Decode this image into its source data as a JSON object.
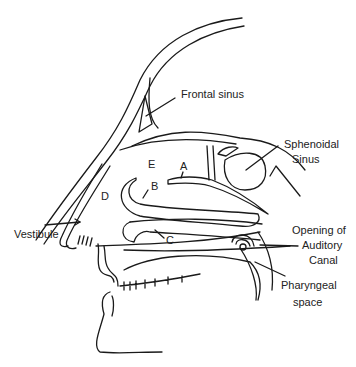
{
  "diagram": {
    "labels": {
      "frontal_sinus": "Frontal sinus",
      "sphenoidal_sinus_1": "Sphenoidal",
      "sphenoidal_sinus_2": "Sinus",
      "vestibule": "Vestibule",
      "auditory_1": "Opening of",
      "auditory_2": "Auditory",
      "auditory_3": "Canal",
      "pharyngeal_1": "Pharyngeal",
      "pharyngeal_2": "space"
    },
    "letters": {
      "A": "A",
      "B": "B",
      "C": "C",
      "D": "D",
      "E": "E"
    },
    "stroke_color": "#1a1a1a",
    "background": "#ffffff"
  }
}
